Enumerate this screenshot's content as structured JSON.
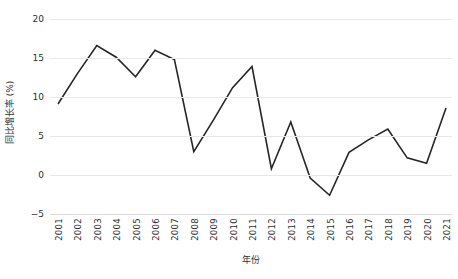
{
  "chart_data": {
    "type": "line",
    "title": "",
    "xlabel": "年份",
    "ylabel": "同比增长率 (%)",
    "categories": [
      "2001",
      "2002",
      "2003",
      "2004",
      "2005",
      "2006",
      "2007",
      "2008",
      "2009",
      "2010",
      "2011",
      "2012",
      "2013",
      "2014",
      "2015",
      "2016",
      "2017",
      "2018",
      "2019",
      "2020",
      "2021"
    ],
    "values": [
      9.1,
      13.0,
      16.6,
      15.1,
      12.6,
      16.0,
      14.8,
      3.0,
      7.0,
      11.2,
      13.9,
      0.8,
      6.8,
      -0.4,
      -2.6,
      2.9,
      4.5,
      5.9,
      2.2,
      1.5,
      8.6
    ],
    "series": [
      {
        "name": "同比增长率",
        "color": "#262626",
        "values": [
          9.1,
          13.0,
          16.6,
          15.1,
          12.6,
          16.0,
          14.8,
          3.0,
          7.0,
          11.2,
          13.9,
          0.8,
          6.8,
          -0.4,
          -2.6,
          2.9,
          4.5,
          5.9,
          2.2,
          1.5,
          8.6
        ]
      }
    ],
    "ylim": [
      -5,
      20
    ],
    "yticks": [
      20,
      15,
      10,
      5,
      0,
      -5
    ],
    "ytick_labels": [
      "20",
      "15",
      "10",
      "5",
      "0",
      "−5"
    ],
    "grid": true,
    "grid_axis": "y",
    "legend": false,
    "legend_position": "none",
    "line_color": "#262626",
    "gridline_color": "#e8e8e8",
    "background_color": "#ffffff",
    "markers": false
  },
  "axis": {
    "y_title": "同比增长率 (%)",
    "x_title": "年份"
  },
  "caption": {
    "clipped_text": ""
  }
}
